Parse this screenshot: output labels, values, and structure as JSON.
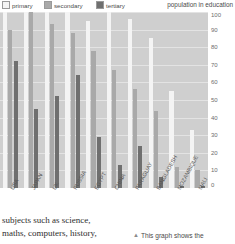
{
  "legend": {
    "items": [
      {
        "label": "primary",
        "color": "#f4f4f4"
      },
      {
        "label": "secondary",
        "color": "#a9a9a9"
      },
      {
        "label": "tertiary",
        "color": "#6f6f6f"
      }
    ]
  },
  "caption": {
    "marker": "▲",
    "text": "This graph shows the"
  },
  "body_copy": {
    "line1": "subjects such as science,",
    "line2": "maths, computers, history,"
  },
  "chart_data": {
    "type": "bar",
    "title": "population in education",
    "xlabel": "",
    "ylabel": "",
    "ylim": [
      0,
      100
    ],
    "yticks": [
      0,
      10,
      20,
      30,
      40,
      50,
      60,
      70,
      80,
      90,
      100
    ],
    "grid": true,
    "legend_position": "top-left",
    "categories": [
      "USA",
      "JAPAN",
      "UK",
      "RUSSIA",
      "EGYPT",
      "CHINA",
      "PARAGUAY",
      "BANGLADESH",
      "MOZAMBIQUE",
      "MALI"
    ],
    "series": [
      {
        "name": "primary",
        "color": "#f4f4f4",
        "values": [
          100,
          100,
          100,
          100,
          95,
          100,
          96,
          85,
          55,
          33
        ]
      },
      {
        "name": "secondary",
        "color": "#a9a9a9",
        "values": [
          90,
          100,
          93,
          88,
          78,
          67,
          56,
          44,
          12,
          10
        ]
      },
      {
        "name": "tertiary",
        "color": "#6f6f6f",
        "values": [
          72,
          45,
          52,
          64,
          29,
          13,
          24,
          6,
          1,
          1
        ]
      }
    ]
  }
}
